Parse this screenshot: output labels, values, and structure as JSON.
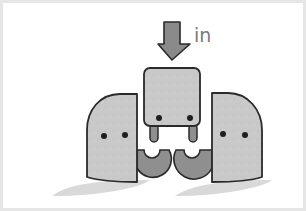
{
  "figure": {
    "label_text": "in",
    "colors": {
      "block_fill": "#c9c9c9",
      "outline": "#2a2a2a",
      "arrow_fill": "#8a8a8a",
      "connector_fill": "#8f8f8f",
      "shadow": "#d6d6d6",
      "frame_border": "#e6e6e6",
      "label": "#7a7a7a"
    },
    "elements": [
      {
        "name": "down-arrow",
        "meaning": "insert"
      },
      {
        "name": "center-block",
        "eyes": 2,
        "legs": 2
      },
      {
        "name": "left-block",
        "eyes": 2,
        "connector": "cup"
      },
      {
        "name": "right-block",
        "eyes": 2,
        "connector": "cup"
      }
    ]
  }
}
